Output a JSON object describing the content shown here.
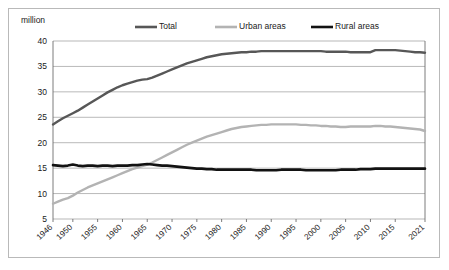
{
  "chart_data": {
    "type": "line",
    "title": "",
    "unit_label": "million",
    "xlabel": "",
    "ylabel": "",
    "ylim": [
      5,
      40
    ],
    "y_ticks": [
      5,
      10,
      15,
      20,
      25,
      30,
      35,
      40
    ],
    "grid": true,
    "legend_position": "top-center",
    "x_tick_labels": [
      "1946",
      "1950",
      "1955",
      "1960",
      "1965",
      "1970",
      "1975",
      "1980",
      "1985",
      "1990",
      "1995",
      "2000",
      "2005",
      "2010",
      "2015",
      "2021"
    ],
    "x_tick_values": [
      1946,
      1950,
      1955,
      1960,
      1965,
      1970,
      1975,
      1980,
      1985,
      1990,
      1995,
      2000,
      2005,
      2010,
      2015,
      2021
    ],
    "xlim": [
      1946,
      2021
    ],
    "x": [
      1946,
      1947,
      1948,
      1949,
      1950,
      1951,
      1952,
      1953,
      1954,
      1955,
      1956,
      1957,
      1958,
      1959,
      1960,
      1961,
      1962,
      1963,
      1964,
      1965,
      1966,
      1967,
      1968,
      1969,
      1970,
      1971,
      1972,
      1973,
      1974,
      1975,
      1976,
      1977,
      1978,
      1979,
      1980,
      1981,
      1982,
      1983,
      1984,
      1985,
      1986,
      1987,
      1988,
      1989,
      1990,
      1991,
      1992,
      1993,
      1994,
      1995,
      1996,
      1997,
      1998,
      1999,
      2000,
      2001,
      2002,
      2003,
      2004,
      2005,
      2006,
      2007,
      2008,
      2009,
      2010,
      2011,
      2012,
      2013,
      2014,
      2015,
      2016,
      2017,
      2018,
      2019,
      2020,
      2021
    ],
    "series": [
      {
        "name": "Total",
        "color": "#575757",
        "width": 2.4,
        "values": [
          23.6,
          24.2,
          24.8,
          25.3,
          25.8,
          26.3,
          26.9,
          27.5,
          28.1,
          28.7,
          29.3,
          29.9,
          30.4,
          30.9,
          31.3,
          31.6,
          31.9,
          32.2,
          32.4,
          32.5,
          32.8,
          33.2,
          33.6,
          34.0,
          34.4,
          34.8,
          35.2,
          35.6,
          35.9,
          36.2,
          36.5,
          36.8,
          37.0,
          37.2,
          37.4,
          37.5,
          37.6,
          37.7,
          37.8,
          37.8,
          37.9,
          37.9,
          38.0,
          38.0,
          38.0,
          38.0,
          38.0,
          38.0,
          38.0,
          38.0,
          38.0,
          38.0,
          38.0,
          38.0,
          38.0,
          37.9,
          37.9,
          37.9,
          37.9,
          37.9,
          37.8,
          37.8,
          37.8,
          37.8,
          37.8,
          38.2,
          38.2,
          38.2,
          38.2,
          38.2,
          38.1,
          38.0,
          37.9,
          37.8,
          37.8,
          37.7
        ]
      },
      {
        "name": "Urban areas",
        "color": "#b3b3b3",
        "width": 2.4,
        "values": [
          8.0,
          8.4,
          8.8,
          9.1,
          9.6,
          10.2,
          10.7,
          11.2,
          11.6,
          12.0,
          12.4,
          12.8,
          13.2,
          13.6,
          14.0,
          14.4,
          14.8,
          15.1,
          15.4,
          15.7,
          16.1,
          16.6,
          17.1,
          17.6,
          18.1,
          18.6,
          19.1,
          19.6,
          20.0,
          20.4,
          20.8,
          21.2,
          21.5,
          21.8,
          22.1,
          22.4,
          22.7,
          22.9,
          23.1,
          23.2,
          23.3,
          23.4,
          23.5,
          23.5,
          23.6,
          23.6,
          23.6,
          23.6,
          23.6,
          23.6,
          23.5,
          23.5,
          23.4,
          23.4,
          23.3,
          23.3,
          23.2,
          23.2,
          23.1,
          23.1,
          23.2,
          23.2,
          23.2,
          23.2,
          23.2,
          23.3,
          23.3,
          23.2,
          23.2,
          23.1,
          23.0,
          22.9,
          22.8,
          22.7,
          22.6,
          22.3
        ]
      },
      {
        "name": "Rural areas",
        "color": "#121212",
        "width": 2.6,
        "values": [
          15.6,
          15.5,
          15.4,
          15.5,
          15.7,
          15.5,
          15.4,
          15.5,
          15.5,
          15.4,
          15.5,
          15.5,
          15.4,
          15.5,
          15.5,
          15.5,
          15.6,
          15.6,
          15.7,
          15.8,
          15.7,
          15.6,
          15.5,
          15.5,
          15.4,
          15.3,
          15.2,
          15.1,
          15.0,
          14.9,
          14.9,
          14.8,
          14.8,
          14.7,
          14.7,
          14.7,
          14.7,
          14.7,
          14.7,
          14.7,
          14.7,
          14.6,
          14.6,
          14.6,
          14.6,
          14.6,
          14.7,
          14.7,
          14.7,
          14.7,
          14.7,
          14.6,
          14.6,
          14.6,
          14.6,
          14.6,
          14.6,
          14.6,
          14.7,
          14.7,
          14.7,
          14.7,
          14.8,
          14.8,
          14.8,
          14.9,
          14.9,
          14.9,
          14.9,
          14.9,
          14.9,
          14.9,
          14.9,
          14.9,
          14.9,
          14.9
        ]
      }
    ]
  },
  "legend": {
    "entries": [
      {
        "label": "Total",
        "color": "#575757"
      },
      {
        "label": "Urban areas",
        "color": "#b3b3b3"
      },
      {
        "label": "Rural areas",
        "color": "#121212"
      }
    ]
  }
}
